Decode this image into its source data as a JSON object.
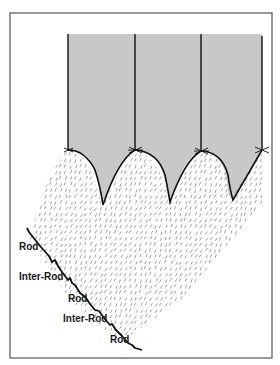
{
  "diagram": {
    "labels": [
      {
        "id": "rod-1",
        "text": "Rod"
      },
      {
        "id": "inter-rod-1",
        "text": "Inter-Rod"
      },
      {
        "id": "rod-2",
        "text": "Rod"
      },
      {
        "id": "inter-rod-2",
        "text": "Inter-Rod"
      },
      {
        "id": "rod-3",
        "text": "Rod"
      }
    ],
    "colors": {
      "frame": "#555555",
      "shaded_region": "#c8c8c8",
      "line": "#111111",
      "hatch": "#666666"
    },
    "column_count": 3
  }
}
